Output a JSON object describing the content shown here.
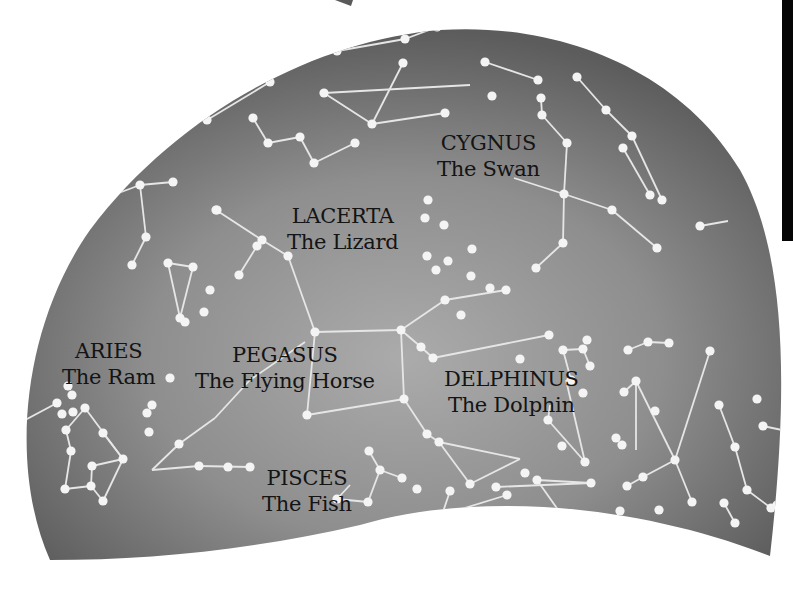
{
  "map": {
    "colors": {
      "sky_light": "#a8a8a8",
      "sky_mid": "#8c8c8c",
      "sky_dark": "#5e5e5e",
      "star": "#f4f4f4",
      "line": "#e6e6e6",
      "label_text": "#141414",
      "page_background": "#ffffff",
      "strip": "#050505"
    },
    "labels": [
      {
        "id": "cygnus",
        "name": "CYGNUS",
        "common": "The Swan",
        "x": 490,
        "y": 156
      },
      {
        "id": "lacerta",
        "name": "LACERTA",
        "common": "The Lizard",
        "x": 347,
        "y": 203
      },
      {
        "id": "aries",
        "name": "ARIES",
        "common": "The Ram",
        "x": 111,
        "y": 338
      },
      {
        "id": "pegasus",
        "name": "PEGASUS",
        "common": "The Flying Horse",
        "x": 283,
        "y": 342
      },
      {
        "id": "delphinus",
        "name": "DELPHINUS",
        "common": "The Dolphin",
        "x": 519,
        "y": 366
      },
      {
        "id": "pisces",
        "name": "PISCES",
        "common": "The Fish",
        "x": 306,
        "y": 465
      }
    ],
    "stars": [
      [
        337,
        51
      ],
      [
        405,
        39
      ],
      [
        437,
        27
      ],
      [
        270,
        82
      ],
      [
        207,
        120
      ],
      [
        253,
        118
      ],
      [
        268,
        143
      ],
      [
        300,
        137
      ],
      [
        314,
        163
      ],
      [
        355,
        143
      ],
      [
        324,
        93
      ],
      [
        372,
        124
      ],
      [
        403,
        63
      ],
      [
        445,
        113
      ],
      [
        485,
        62
      ],
      [
        492,
        96
      ],
      [
        538,
        80
      ],
      [
        541,
        98
      ],
      [
        542,
        115
      ],
      [
        567,
        143
      ],
      [
        564,
        194
      ],
      [
        612,
        210
      ],
      [
        657,
        248
      ],
      [
        563,
        243
      ],
      [
        536,
        268
      ],
      [
        577,
        77
      ],
      [
        606,
        110
      ],
      [
        632,
        136
      ],
      [
        623,
        148
      ],
      [
        650,
        195
      ],
      [
        662,
        200
      ],
      [
        700,
        226
      ],
      [
        728,
        121
      ],
      [
        217,
        210
      ],
      [
        288,
        256
      ],
      [
        257,
        246
      ],
      [
        239,
        275
      ],
      [
        210,
        290
      ],
      [
        204,
        312
      ],
      [
        185,
        322
      ],
      [
        170,
        378
      ],
      [
        216,
        210
      ],
      [
        262,
        240
      ],
      [
        173,
        182
      ],
      [
        140,
        185
      ],
      [
        146,
        237
      ],
      [
        132,
        265
      ],
      [
        168,
        263
      ],
      [
        193,
        267
      ],
      [
        180,
        318
      ],
      [
        315,
        332
      ],
      [
        401,
        330
      ],
      [
        404,
        399
      ],
      [
        307,
        415
      ],
      [
        445,
        300
      ],
      [
        506,
        290
      ],
      [
        421,
        347
      ],
      [
        433,
        358
      ],
      [
        549,
        335
      ],
      [
        587,
        340
      ],
      [
        563,
        350
      ],
      [
        583,
        349
      ],
      [
        590,
        366
      ],
      [
        571,
        380
      ],
      [
        583,
        393
      ],
      [
        548,
        420
      ],
      [
        585,
        462
      ],
      [
        525,
        473
      ],
      [
        562,
        446
      ],
      [
        427,
        434
      ],
      [
        439,
        442
      ],
      [
        470,
        484
      ],
      [
        402,
        8
      ],
      [
        427,
        256
      ],
      [
        425,
        218
      ],
      [
        428,
        200
      ],
      [
        444,
        225
      ],
      [
        448,
        261
      ],
      [
        472,
        249
      ],
      [
        471,
        276
      ],
      [
        436,
        270
      ],
      [
        461,
        315
      ],
      [
        490,
        288
      ],
      [
        520,
        359
      ],
      [
        636,
        381
      ],
      [
        628,
        350
      ],
      [
        648,
        342
      ],
      [
        669,
        343
      ],
      [
        624,
        392
      ],
      [
        616,
        438
      ],
      [
        622,
        445
      ],
      [
        655,
        411
      ],
      [
        675,
        460
      ],
      [
        710,
        351
      ],
      [
        692,
        502
      ],
      [
        627,
        486
      ],
      [
        643,
        477
      ],
      [
        719,
        405
      ],
      [
        735,
        447
      ],
      [
        747,
        490
      ],
      [
        771,
        508
      ],
      [
        777,
        505
      ],
      [
        763,
        426
      ],
      [
        757,
        399
      ],
      [
        152,
        405
      ],
      [
        179,
        444
      ],
      [
        199,
        466
      ],
      [
        228,
        467
      ],
      [
        250,
        467
      ],
      [
        85,
        408
      ],
      [
        66,
        430
      ],
      [
        71,
        451
      ],
      [
        65,
        489
      ],
      [
        91,
        486
      ],
      [
        103,
        501
      ],
      [
        123,
        459
      ],
      [
        103,
        433
      ],
      [
        92,
        466
      ],
      [
        147,
        413
      ],
      [
        149,
        432
      ],
      [
        369,
        451
      ],
      [
        380,
        470
      ],
      [
        402,
        478
      ],
      [
        417,
        489
      ],
      [
        368,
        502
      ],
      [
        337,
        499
      ],
      [
        496,
        487
      ],
      [
        591,
        483
      ],
      [
        537,
        480
      ],
      [
        561,
        514
      ],
      [
        507,
        495
      ],
      [
        442,
        515
      ],
      [
        450,
        491
      ],
      [
        620,
        511
      ],
      [
        611,
        528
      ],
      [
        659,
        510
      ],
      [
        668,
        545
      ],
      [
        724,
        503
      ],
      [
        735,
        523
      ],
      [
        57,
        403
      ],
      [
        62,
        414
      ],
      [
        68,
        386
      ],
      [
        72,
        395
      ],
      [
        73,
        412
      ]
    ],
    "lines": [
      [
        [
          337,
          51
        ],
        [
          405,
          39
        ]
      ],
      [
        [
          405,
          39
        ],
        [
          437,
          27
        ]
      ],
      [
        [
          270,
          82
        ],
        [
          207,
          120
        ]
      ],
      [
        [
          253,
          118
        ],
        [
          268,
          143
        ]
      ],
      [
        [
          268,
          143
        ],
        [
          300,
          137
        ]
      ],
      [
        [
          300,
          137
        ],
        [
          314,
          163
        ]
      ],
      [
        [
          314,
          163
        ],
        [
          355,
          143
        ]
      ],
      [
        [
          324,
          93
        ],
        [
          372,
          124
        ]
      ],
      [
        [
          372,
          124
        ],
        [
          403,
          63
        ]
      ],
      [
        [
          324,
          93
        ],
        [
          470,
          85
        ]
      ],
      [
        [
          372,
          124
        ],
        [
          445,
          113
        ]
      ],
      [
        [
          485,
          62
        ],
        [
          538,
          80
        ]
      ],
      [
        [
          541,
          98
        ],
        [
          542,
          115
        ]
      ],
      [
        [
          542,
          115
        ],
        [
          567,
          143
        ]
      ],
      [
        [
          567,
          143
        ],
        [
          564,
          194
        ]
      ],
      [
        [
          564,
          194
        ],
        [
          563,
          243
        ]
      ],
      [
        [
          563,
          243
        ],
        [
          536,
          268
        ]
      ],
      [
        [
          564,
          194
        ],
        [
          612,
          210
        ]
      ],
      [
        [
          612,
          210
        ],
        [
          657,
          248
        ]
      ],
      [
        [
          514,
          178
        ],
        [
          564,
          194
        ]
      ],
      [
        [
          577,
          77
        ],
        [
          606,
          110
        ]
      ],
      [
        [
          606,
          110
        ],
        [
          632,
          136
        ]
      ],
      [
        [
          623,
          148
        ],
        [
          650,
          195
        ]
      ],
      [
        [
          632,
          136
        ],
        [
          662,
          200
        ]
      ],
      [
        [
          700,
          226
        ],
        [
          728,
          221
        ]
      ],
      [
        [
          216,
          210
        ],
        [
          262,
          240
        ]
      ],
      [
        [
          262,
          240
        ],
        [
          288,
          256
        ]
      ],
      [
        [
          288,
          256
        ],
        [
          315,
          332
        ]
      ],
      [
        [
          257,
          246
        ],
        [
          239,
          275
        ]
      ],
      [
        [
          173,
          182
        ],
        [
          140,
          185
        ]
      ],
      [
        [
          140,
          185
        ],
        [
          100,
          200
        ]
      ],
      [
        [
          140,
          185
        ],
        [
          146,
          237
        ]
      ],
      [
        [
          146,
          237
        ],
        [
          132,
          265
        ]
      ],
      [
        [
          168,
          263
        ],
        [
          193,
          267
        ]
      ],
      [
        [
          168,
          263
        ],
        [
          180,
          318
        ]
      ],
      [
        [
          193,
          267
        ],
        [
          180,
          318
        ]
      ],
      [
        [
          315,
          332
        ],
        [
          401,
          330
        ]
      ],
      [
        [
          401,
          330
        ],
        [
          404,
          399
        ]
      ],
      [
        [
          404,
          399
        ],
        [
          307,
          415
        ]
      ],
      [
        [
          307,
          415
        ],
        [
          315,
          332
        ]
      ],
      [
        [
          401,
          330
        ],
        [
          445,
          300
        ]
      ],
      [
        [
          445,
          300
        ],
        [
          506,
          290
        ]
      ],
      [
        [
          401,
          330
        ],
        [
          421,
          347
        ]
      ],
      [
        [
          421,
          347
        ],
        [
          433,
          358
        ]
      ],
      [
        [
          433,
          358
        ],
        [
          549,
          335
        ]
      ],
      [
        [
          404,
          399
        ],
        [
          427,
          434
        ]
      ],
      [
        [
          427,
          434
        ],
        [
          439,
          442
        ]
      ],
      [
        [
          439,
          442
        ],
        [
          520,
          459
        ]
      ],
      [
        [
          439,
          442
        ],
        [
          470,
          484
        ]
      ],
      [
        [
          470,
          484
        ],
        [
          520,
          459
        ]
      ],
      [
        [
          305,
          342
        ],
        [
          250,
          380
        ]
      ],
      [
        [
          250,
          380
        ],
        [
          215,
          418
        ]
      ],
      [
        [
          215,
          418
        ],
        [
          179,
          444
        ]
      ],
      [
        [
          179,
          444
        ],
        [
          152,
          470
        ]
      ],
      [
        [
          152,
          470
        ],
        [
          199,
          466
        ]
      ],
      [
        [
          199,
          466
        ],
        [
          250,
          467
        ]
      ],
      [
        [
          563,
          350
        ],
        [
          583,
          349
        ]
      ],
      [
        [
          563,
          350
        ],
        [
          571,
          380
        ]
      ],
      [
        [
          583,
          349
        ],
        [
          590,
          366
        ]
      ],
      [
        [
          550,
          405
        ],
        [
          548,
          420
        ]
      ],
      [
        [
          548,
          420
        ],
        [
          585,
          462
        ]
      ],
      [
        [
          585,
          462
        ],
        [
          566,
          380
        ]
      ],
      [
        [
          628,
          350
        ],
        [
          648,
          342
        ]
      ],
      [
        [
          648,
          342
        ],
        [
          669,
          343
        ]
      ],
      [
        [
          636,
          381
        ],
        [
          624,
          392
        ]
      ],
      [
        [
          636,
          381
        ],
        [
          675,
          460
        ]
      ],
      [
        [
          636,
          381
        ],
        [
          636,
          450
        ]
      ],
      [
        [
          710,
          351
        ],
        [
          675,
          460
        ]
      ],
      [
        [
          675,
          460
        ],
        [
          692,
          502
        ]
      ],
      [
        [
          675,
          460
        ],
        [
          643,
          477
        ]
      ],
      [
        [
          643,
          477
        ],
        [
          627,
          486
        ]
      ],
      [
        [
          719,
          405
        ],
        [
          735,
          447
        ]
      ],
      [
        [
          735,
          447
        ],
        [
          747,
          490
        ]
      ],
      [
        [
          747,
          490
        ],
        [
          771,
          508
        ]
      ],
      [
        [
          763,
          426
        ],
        [
          782,
          430
        ]
      ],
      [
        [
          85,
          408
        ],
        [
          123,
          459
        ]
      ],
      [
        [
          123,
          459
        ],
        [
          103,
          433
        ]
      ],
      [
        [
          85,
          408
        ],
        [
          66,
          430
        ]
      ],
      [
        [
          66,
          430
        ],
        [
          71,
          451
        ]
      ],
      [
        [
          71,
          451
        ],
        [
          65,
          489
        ]
      ],
      [
        [
          65,
          489
        ],
        [
          91,
          486
        ]
      ],
      [
        [
          91,
          486
        ],
        [
          103,
          501
        ]
      ],
      [
        [
          103,
          501
        ],
        [
          123,
          459
        ]
      ],
      [
        [
          91,
          486
        ],
        [
          92,
          466
        ]
      ],
      [
        [
          92,
          466
        ],
        [
          123,
          459
        ]
      ],
      [
        [
          57,
          403
        ],
        [
          25,
          420
        ]
      ],
      [
        [
          369,
          451
        ],
        [
          380,
          470
        ]
      ],
      [
        [
          380,
          470
        ],
        [
          402,
          478
        ]
      ],
      [
        [
          380,
          470
        ],
        [
          368,
          502
        ]
      ],
      [
        [
          368,
          502
        ],
        [
          337,
          499
        ]
      ],
      [
        [
          337,
          499
        ],
        [
          350,
          485
        ]
      ],
      [
        [
          496,
          487
        ],
        [
          591,
          483
        ]
      ],
      [
        [
          591,
          483
        ],
        [
          537,
          480
        ]
      ],
      [
        [
          537,
          480
        ],
        [
          561,
          514
        ]
      ],
      [
        [
          507,
          495
        ],
        [
          442,
          515
        ]
      ],
      [
        [
          442,
          515
        ],
        [
          450,
          491
        ]
      ],
      [
        [
          620,
          511
        ],
        [
          611,
          528
        ]
      ],
      [
        [
          724,
          503
        ],
        [
          735,
          523
        ]
      ],
      [
        [
          640,
          540
        ],
        [
          668,
          545
        ]
      ]
    ]
  }
}
